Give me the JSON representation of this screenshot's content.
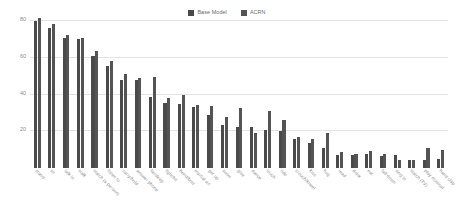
{
  "chart_data": {
    "type": "bar",
    "title": "",
    "subtitle": "",
    "xlabel": "",
    "ylabel": "",
    "ylim": [
      0,
      84
    ],
    "yticks": [
      20,
      40,
      60,
      80
    ],
    "ytick_labels": [
      "20",
      "40",
      "60",
      "80"
    ],
    "grid": true,
    "legend_position": "top-center",
    "categories": [
      "stand",
      "sit",
      "talk to",
      "walk",
      "watch (a person)",
      "listen to",
      "carry/hold",
      "answer phone",
      "lie/sleep",
      "fight/hit",
      "bend/bow",
      "martial art",
      "get up",
      "swim",
      "give",
      "dance",
      "touch",
      "ride",
      "crouch/kneel",
      "kiss",
      "hug",
      "read",
      "drink",
      "eat",
      "fall down",
      "sing to",
      "watch (TV)",
      "play musical",
      "hand clap"
    ],
    "series": [
      {
        "name": "Base Model",
        "color": "#4a4a4a",
        "values": [
          80.3,
          76.6,
          70.7,
          70.4,
          60.9,
          55.8,
          47.8,
          47.9,
          38.6,
          35.5,
          34.8,
          33.5,
          29.0,
          23.3,
          22.6,
          22.2,
          20.6,
          20.4,
          15.6,
          13.5,
          10.8,
          7.3,
          7.2,
          7.4,
          6.4,
          7.1,
          4.2,
          4.6,
          5.1
        ]
      },
      {
        "name": "ACRN",
        "color": "#545454",
        "values": [
          81.9,
          78.3,
          72.6,
          70.9,
          63.6,
          58.3,
          51.5,
          49.2,
          49.6,
          38.3,
          39.8,
          34.3,
          33.7,
          28.0,
          32.9,
          19.2,
          31.1,
          26.2,
          16.9,
          15.9,
          19.1,
          8.6,
          7.8,
          9.4,
          7.4,
          4.3,
          4.3,
          10.8,
          9.7
        ]
      }
    ]
  },
  "legend": {
    "entries": [
      {
        "label": "Base Model"
      },
      {
        "label": "ACRN"
      }
    ]
  }
}
